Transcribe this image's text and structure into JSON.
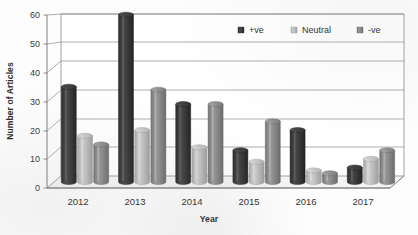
{
  "chart_data": {
    "type": "bar",
    "title": "",
    "subtitle": "",
    "xlabel": "Year",
    "ylabel": "Number of Articles",
    "categories": [
      "2012",
      "2013",
      "2014",
      "2015",
      "2016",
      "2017"
    ],
    "series": [
      {
        "name": "+ve",
        "color": "#3f3f3f",
        "values": [
          33,
          58,
          27,
          11,
          18,
          5
        ]
      },
      {
        "name": "Neutral",
        "color": "#bdbdbd",
        "values": [
          16,
          18,
          12,
          7,
          4,
          8
        ]
      },
      {
        "name": "-ve",
        "color": "#8c8c8c",
        "values": [
          13,
          32,
          27,
          21,
          3,
          11
        ]
      }
    ],
    "ylim": [
      0,
      60
    ],
    "yticks": [
      0,
      10,
      20,
      30,
      40,
      50,
      60
    ],
    "ytick_labels": [
      "0",
      "10",
      "20",
      "30",
      "40",
      "50",
      "60"
    ],
    "grid": true,
    "grid_axis": "y",
    "legend_position": "top-right-inside",
    "style": "3d-cylinder-columns",
    "annotations": []
  },
  "axes": {
    "y_title": "Number of Articles",
    "x_title": "Year"
  },
  "legend": {
    "entries": [
      {
        "label": "+ve",
        "swatch": "legend-swatch-positive"
      },
      {
        "label": "Neutral",
        "swatch": "legend-swatch-neutral"
      },
      {
        "label": "-ve",
        "swatch": "legend-swatch-negative"
      }
    ]
  },
  "colors": {
    "positive": "#3f3f3f",
    "neutral": "#bdbdbd",
    "negative": "#8c8c8c",
    "gridline": "#8d8d8d",
    "axis": "#6f6f6f",
    "plot_background": "#ffffff",
    "floor": "#f4f4f4",
    "text": "#333333"
  }
}
